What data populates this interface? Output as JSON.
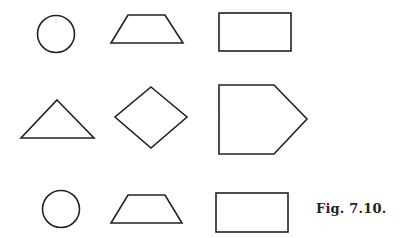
{
  "figure": {
    "caption": "Fig. 7.10.",
    "stroke_color": "#222222",
    "background": "#ffffff",
    "rows": [
      {
        "shapes": [
          "circle",
          "trapezoid",
          "rectangle"
        ]
      },
      {
        "shapes": [
          "triangle",
          "rhombus",
          "pentagon"
        ]
      },
      {
        "shapes": [
          "circle",
          "trapezoid",
          "rectangle"
        ]
      }
    ]
  }
}
